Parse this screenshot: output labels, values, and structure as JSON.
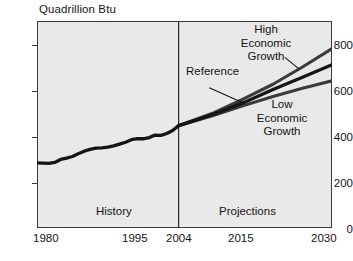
{
  "chart_data": {
    "type": "line",
    "title": "Quadrillion Btu",
    "xlabel": "",
    "ylabel": "Quadrillion Btu",
    "xlim": [
      1980,
      2030
    ],
    "ylim": [
      0,
      900
    ],
    "grid": false,
    "legend_position": "inline-annotations",
    "y_ticks": [
      "0",
      "200",
      "400",
      "600",
      "800"
    ],
    "y_tick_values": [
      0,
      200,
      400,
      600,
      800
    ],
    "x_ticks": [
      "1980",
      "1995",
      "2004",
      "2015",
      "2030"
    ],
    "x_tick_values": [
      1980,
      1995,
      2004,
      2015,
      2030
    ],
    "divider_year": 2004,
    "region_labels": [
      {
        "text": "History",
        "year": 1992
      },
      {
        "text": "Projections",
        "year": 2017
      }
    ],
    "annotations": [
      {
        "text": "High Economic Growth",
        "lines": [
          "High",
          "Economic",
          "Growth"
        ]
      },
      {
        "text": "Reference",
        "lines": [
          "Reference"
        ]
      },
      {
        "text": "Low Economic Growth",
        "lines": [
          "Low",
          "Economic",
          "Growth"
        ]
      }
    ],
    "series": [
      {
        "name": "History",
        "color": "#1a1a1a",
        "x": [
          1980,
          1981,
          1982,
          1983,
          1984,
          1985,
          1986,
          1987,
          1988,
          1989,
          1990,
          1991,
          1992,
          1993,
          1994,
          1995,
          1996,
          1997,
          1998,
          1999,
          2000,
          2001,
          2002,
          2003,
          2004
        ],
        "values": [
          283,
          282,
          281,
          285,
          298,
          304,
          311,
          323,
          334,
          342,
          347,
          348,
          352,
          357,
          365,
          373,
          384,
          389,
          388,
          393,
          404,
          403,
          411,
          424,
          445
        ]
      },
      {
        "name": "High Economic Growth",
        "color": "#3b3b3b",
        "x": [
          2004,
          2010,
          2015,
          2020,
          2025,
          2030
        ],
        "values": [
          445,
          501,
          561,
          625,
          700,
          780
        ]
      },
      {
        "name": "Reference",
        "color": "#1a1a1a",
        "x": [
          2004,
          2010,
          2015,
          2020,
          2025,
          2030
        ],
        "values": [
          445,
          495,
          545,
          602,
          655,
          710
        ]
      },
      {
        "name": "Low Economic Growth",
        "color": "#3b3b3b",
        "x": [
          2004,
          2010,
          2015,
          2020,
          2025,
          2030
        ],
        "values": [
          445,
          490,
          532,
          572,
          608,
          640
        ]
      }
    ]
  }
}
